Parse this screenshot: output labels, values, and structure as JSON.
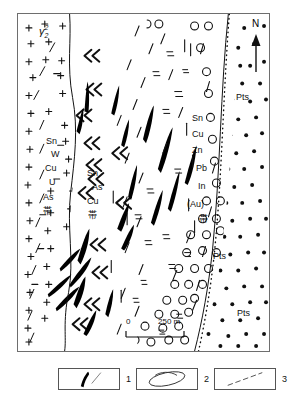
{
  "figure": {
    "type": "geological-zonation-map",
    "frame": {
      "x": 17,
      "y": 13,
      "width": 253,
      "height": 339
    }
  },
  "compass": {
    "north_label": "N",
    "arrow": "north-arrow"
  },
  "scalebar": {
    "zero_label": "0",
    "max_label": "250 m",
    "unit": "m",
    "length_value": 250
  },
  "zones": [
    {
      "id": "granite",
      "name": "granite-pluton",
      "pattern": "plus-crosses",
      "symbol": "γ",
      "symbol_sup": "2",
      "symbol_sub": "2",
      "mineral_labels": [
        "Sn",
        "W",
        "Cu",
        "U",
        "As",
        "帯"
      ]
    },
    {
      "id": "inner-contact",
      "name": "inner-contact-zone",
      "pattern": "double-chevrons",
      "mineral_labels": [
        "Sn",
        "As",
        "Cu",
        "帯"
      ]
    },
    {
      "id": "outer-zone",
      "name": "outer-vein-zone",
      "pattern": "veins-and-dashes",
      "mineral_labels": [
        "Sn",
        "Cu",
        "Zn",
        "Pb",
        "In",
        "(Au)",
        "帯"
      ]
    },
    {
      "id": "pts-ring",
      "name": "pyroclastic-ring-zone",
      "pattern": "open-circles",
      "unit_labels": [
        "Pts",
        "Pts"
      ]
    },
    {
      "id": "pts-dotted",
      "name": "pyroclastic-dotted-zone",
      "pattern": "filled-dots",
      "unit_labels": [
        "Pts"
      ]
    }
  ],
  "map_labels": [
    {
      "text": "γ",
      "x": 38,
      "y": 26,
      "kind": "rock-symbol"
    },
    {
      "text": "Sn",
      "x": 45,
      "y": 140,
      "kind": "mineral"
    },
    {
      "text": "W",
      "x": 50,
      "y": 153,
      "kind": "mineral"
    },
    {
      "text": "Cu",
      "x": 44,
      "y": 167,
      "kind": "mineral"
    },
    {
      "text": "U",
      "x": 48,
      "y": 181,
      "kind": "mineral"
    },
    {
      "text": "As",
      "x": 42,
      "y": 196,
      "kind": "mineral"
    },
    {
      "text": "帯",
      "x": 42,
      "y": 210,
      "kind": "zone-suffix"
    },
    {
      "text": "Sn",
      "x": 86,
      "y": 172,
      "kind": "mineral"
    },
    {
      "text": "As",
      "x": 91,
      "y": 186,
      "kind": "mineral"
    },
    {
      "text": "Cu",
      "x": 86,
      "y": 200,
      "kind": "mineral"
    },
    {
      "text": "帯",
      "x": 87,
      "y": 214,
      "kind": "zone-suffix"
    },
    {
      "text": "Sn",
      "x": 191,
      "y": 117,
      "kind": "mineral"
    },
    {
      "text": "Cu",
      "x": 191,
      "y": 133,
      "kind": "mineral"
    },
    {
      "text": "Zn",
      "x": 191,
      "y": 149,
      "kind": "mineral"
    },
    {
      "text": "Pb",
      "x": 195,
      "y": 167,
      "kind": "mineral"
    },
    {
      "text": "In",
      "x": 196,
      "y": 185,
      "kind": "mineral"
    },
    {
      "text": "(Au)",
      "x": 187,
      "y": 203,
      "kind": "mineral"
    },
    {
      "text": "帯",
      "x": 198,
      "y": 218,
      "kind": "zone-suffix"
    },
    {
      "text": "Pts",
      "x": 235,
      "y": 96,
      "kind": "unit"
    },
    {
      "text": "Pts",
      "x": 212,
      "y": 255,
      "kind": "unit"
    },
    {
      "text": "Pts",
      "x": 236,
      "y": 312,
      "kind": "unit"
    }
  ],
  "legend": {
    "items": [
      {
        "number": "1",
        "symbol": "ore-vein",
        "description": "ore vein"
      },
      {
        "number": "2",
        "symbol": "ellipse-outline",
        "description": "breccia pipe"
      },
      {
        "number": "3",
        "symbol": "dashed-line",
        "description": "fault"
      }
    ]
  },
  "colors": {
    "ink": "#000000",
    "frame": "#6e6e6e",
    "legend_border": "#555555",
    "background": "#ffffff"
  }
}
